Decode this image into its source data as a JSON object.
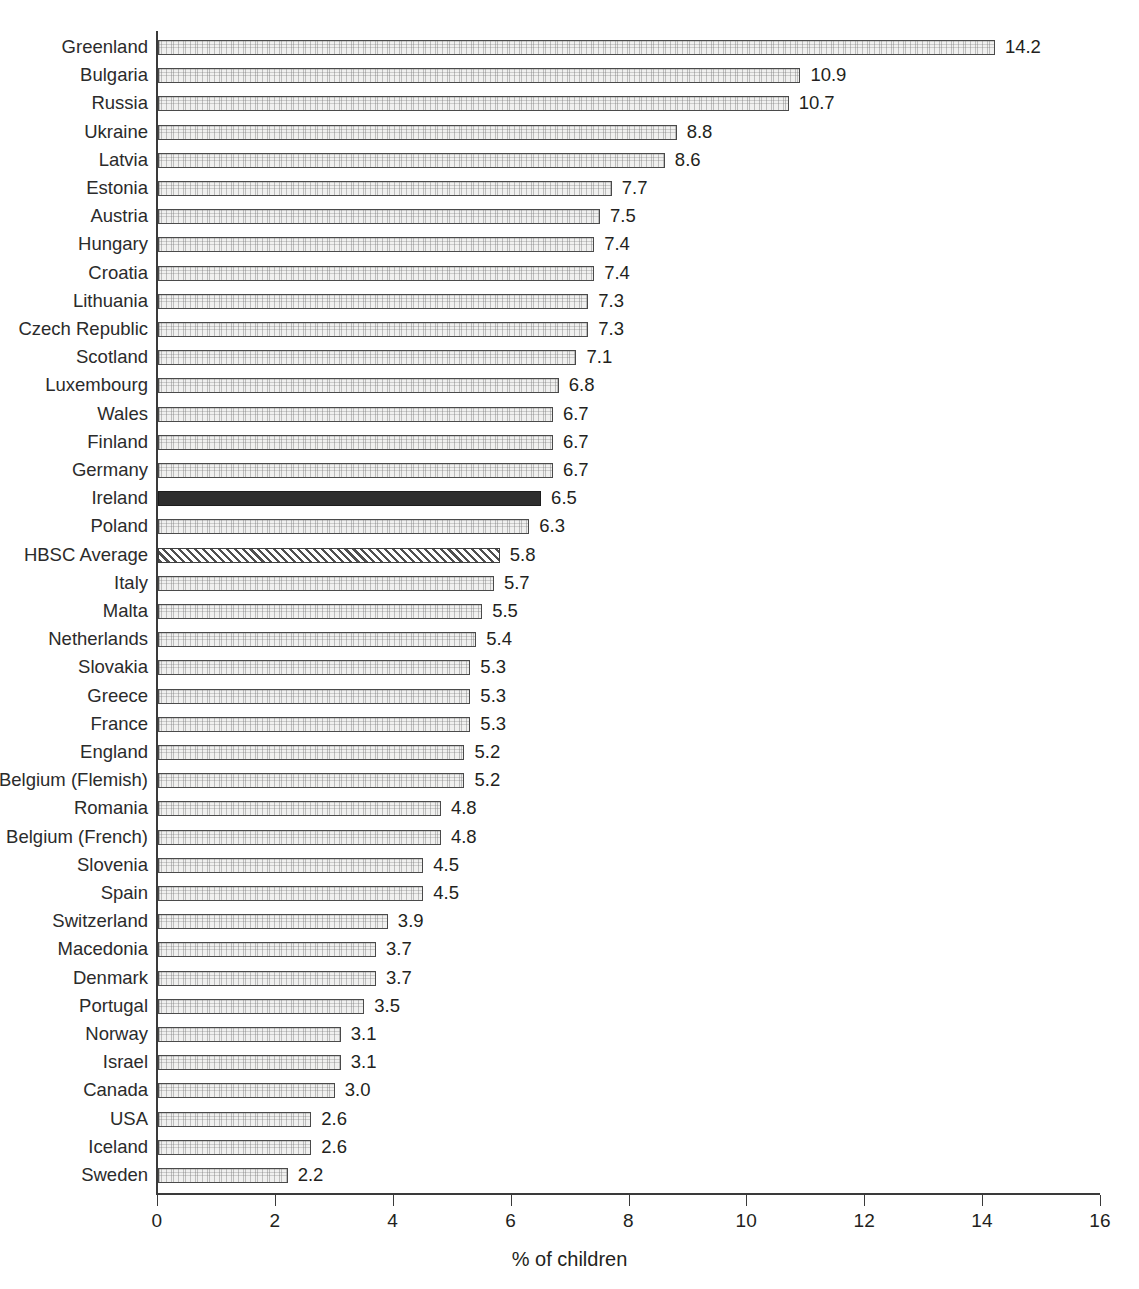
{
  "chart_data": {
    "type": "bar",
    "orientation": "horizontal",
    "title": "",
    "subtitle": "",
    "xlabel": "% of children",
    "ylabel": "",
    "xlim": [
      0,
      16
    ],
    "xticks": [
      0,
      2,
      4,
      6,
      8,
      10,
      12,
      14,
      16
    ],
    "xtick_labels": [
      "0",
      "2",
      "4",
      "6",
      "8",
      "10",
      "12",
      "14",
      "16"
    ],
    "grid": false,
    "legend": null,
    "value_label_format": "one-decimal",
    "categories": [
      "Greenland",
      "Bulgaria",
      "Russia",
      "Ukraine",
      "Latvia",
      "Estonia",
      "Austria",
      "Hungary",
      "Croatia",
      "Lithuania",
      "Czech Republic",
      "Scotland",
      "Luxembourg",
      "Wales",
      "Finland",
      "Germany",
      "Ireland",
      "Poland",
      "HBSC Average",
      "Italy",
      "Malta",
      "Netherlands",
      "Slovakia",
      "Greece",
      "France",
      "England",
      "Belgium (Flemish)",
      "Romania",
      "Belgium (French)",
      "Slovenia",
      "Spain",
      "Switzerland",
      "Macedonia",
      "Denmark",
      "Portugal",
      "Norway",
      "Israel",
      "Canada",
      "USA",
      "Iceland",
      "Sweden"
    ],
    "values": [
      14.2,
      10.9,
      10.7,
      8.8,
      8.6,
      7.7,
      7.5,
      7.4,
      7.4,
      7.3,
      7.3,
      7.1,
      6.8,
      6.7,
      6.7,
      6.7,
      6.5,
      6.3,
      5.8,
      5.7,
      5.5,
      5.4,
      5.3,
      5.3,
      5.3,
      5.2,
      5.2,
      4.8,
      4.8,
      4.5,
      4.5,
      3.9,
      3.7,
      3.7,
      3.5,
      3.1,
      3.1,
      3.0,
      2.6,
      2.6,
      2.2
    ],
    "value_labels": [
      "14.2",
      "10.9",
      "10.7",
      "8.8",
      "8.6",
      "7.7",
      "7.5",
      "7.4",
      "7.4",
      "7.3",
      "7.3",
      "7.1",
      "6.8",
      "6.7",
      "6.7",
      "6.7",
      "6.5",
      "6.3",
      "5.8",
      "5.7",
      "5.5",
      "5.4",
      "5.3",
      "5.3",
      "5.3",
      "5.2",
      "5.2",
      "4.8",
      "4.8",
      "4.5",
      "4.5",
      "3.9",
      "3.7",
      "3.7",
      "3.5",
      "3.1",
      "3.1",
      "3.0",
      "2.6",
      "2.6",
      "2.2"
    ],
    "bar_styles": [
      "normal",
      "normal",
      "normal",
      "normal",
      "normal",
      "normal",
      "normal",
      "normal",
      "normal",
      "normal",
      "normal",
      "normal",
      "normal",
      "normal",
      "normal",
      "normal",
      "highlight",
      "normal",
      "hatched",
      "normal",
      "normal",
      "normal",
      "normal",
      "normal",
      "normal",
      "normal",
      "normal",
      "normal",
      "normal",
      "normal",
      "normal",
      "normal",
      "normal",
      "normal",
      "normal",
      "normal",
      "normal",
      "normal",
      "normal",
      "normal",
      "normal"
    ],
    "highlight_category": "Ireland",
    "average_category": "HBSC Average",
    "colors": {
      "bar_fill": "#f0f0ef",
      "bar_edge": "#4a4a4a",
      "highlight_fill": "#2e2e2e",
      "hatch_stroke": "#4f4f4f",
      "axis": "#3a3a3a",
      "text": "#231f20",
      "background": "#ffffff"
    }
  }
}
